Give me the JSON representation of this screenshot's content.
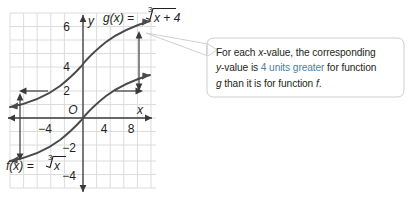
{
  "figure": {
    "title_label_g": "g(x) = ",
    "title_label_g_radical": "x + 4",
    "title_label_f": "f(x) = ",
    "title_label_f_radical": "x",
    "radical_index": "3",
    "axis_x_label": "x",
    "axis_y_label": "y",
    "origin_label": "O",
    "x_ticks": [
      {
        "label": "−4",
        "value": -4
      },
      {
        "label": "4",
        "value": 4
      },
      {
        "label": "8",
        "value": 8
      }
    ],
    "y_ticks": [
      {
        "label": "6",
        "value": 6
      },
      {
        "label": "4",
        "value": 4
      },
      {
        "label": "2",
        "value": 2
      },
      {
        "label": "−2",
        "value": -2
      },
      {
        "label": "−4",
        "value": -4
      }
    ],
    "colors": {
      "curve": "#4a4a4a",
      "axis": "#3a3a3a",
      "grid": "#dcdcdc",
      "accent_text": "#4c7fa0",
      "body_text": "#231f20",
      "bubble_stroke": "#c9c9c9"
    },
    "axis_ranges": {
      "xlim": [
        -5.5,
        5.5
      ],
      "ylim": [
        -5,
        5.5
      ],
      "grid": true
    },
    "measure_arrows": [
      {
        "name": "left-offset-arrow",
        "x_value": -4.7,
        "from_y": -3,
        "to_y": 2
      },
      {
        "name": "right-offset-arrow",
        "x_value": 9.0,
        "from_y": 2,
        "to_y": 6.3
      }
    ]
  },
  "callout": {
    "line1_a": "For each ",
    "line1_x": "x",
    "line1_b": "-value, the corresponding",
    "line2_y": "y",
    "line2_a": "-value is ",
    "line2_accent": "4 units greater",
    "line2_b": " for function",
    "line3_g": "g",
    "line3_a": " than it is for function ",
    "line3_f": "f",
    "line3_b": "."
  }
}
